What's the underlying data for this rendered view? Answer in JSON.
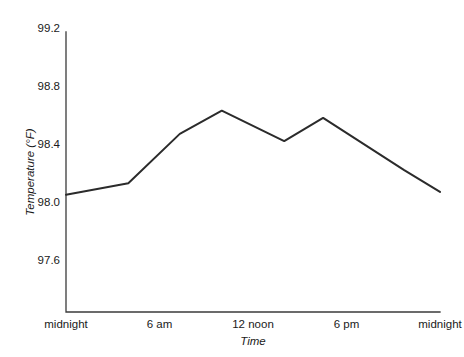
{
  "chart_data": {
    "type": "line",
    "title": "",
    "xlabel": "Time",
    "ylabel": "Temperature (°F)",
    "grid": false,
    "legend": "none",
    "xlim": [
      0,
      24
    ],
    "ylim": [
      97.4,
      99.3
    ],
    "x_tick_labels": [
      "midnight",
      "6 am",
      "12 noon",
      "6 pm",
      "midnight"
    ],
    "x_tick_values": [
      0,
      6,
      12,
      18,
      24
    ],
    "y_tick_labels": [
      "97.6",
      "98.0",
      "98.4",
      "98.8",
      "99.2"
    ],
    "y_tick_values": [
      97.6,
      98.0,
      98.4,
      98.8,
      99.2
    ],
    "series": [
      {
        "name": "Body temperature",
        "x": [
          0,
          4,
          7.3,
          10,
          14,
          16.5,
          21.7,
          24
        ],
        "values": [
          98.05,
          98.13,
          98.47,
          98.63,
          98.42,
          98.58,
          98.22,
          98.07
        ]
      }
    ]
  },
  "axis": {
    "y_title": "Temperature (°F)",
    "x_title": "Time",
    "y_ticks": [
      {
        "label": "99.2",
        "value": 99.2
      },
      {
        "label": "98.8",
        "value": 98.8
      },
      {
        "label": "98.4",
        "value": 98.4
      },
      {
        "label": "98.0",
        "value": 98.0
      },
      {
        "label": "97.6",
        "value": 97.6
      }
    ],
    "x_ticks": [
      {
        "label": "midnight",
        "value": 0
      },
      {
        "label": "6 am",
        "value": 6
      },
      {
        "label": "12 noon",
        "value": 12
      },
      {
        "label": "6 pm",
        "value": 18
      },
      {
        "label": "midnight",
        "value": 24
      }
    ]
  },
  "colors": {
    "line": "#2b2b2b",
    "axis": "#3b3b3b",
    "text": "#1a1a1a",
    "background": "#ffffff"
  }
}
